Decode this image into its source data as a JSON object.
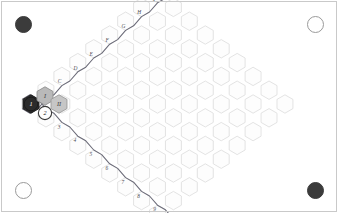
{
  "figure": {
    "width": 338,
    "height": 213,
    "background_color": "#ffffff",
    "frame_color": "#c9c9c9"
  },
  "lattice": {
    "description": "Rhombus-shaped honeycomb (hexagonal) lattice of pointy-top hexagons",
    "cell_stroke_color": "#dcdcdc",
    "cell_fill_color": "#fdfdfd",
    "hex_radius": 9.2,
    "columns": 17,
    "left_vertex": {
      "x": 30,
      "y": 104
    },
    "right_vertex": {
      "x": 312,
      "y": 104
    },
    "top_vertex": {
      "x": 176,
      "y": 14
    },
    "bottom_vertex": {
      "x": 176,
      "y": 196
    }
  },
  "boundary_paths": {
    "upper_left": {
      "name": "letter-edge-path",
      "stroke_color": "#6b6b78",
      "label_color": "#4a4a52",
      "labels": [
        "A",
        "B",
        "C",
        "D",
        "E",
        "F",
        "G",
        "H",
        "I",
        "J",
        "K"
      ]
    },
    "lower_left": {
      "name": "number-edge-path",
      "stroke_color": "#6b6b78",
      "label_color": "#4a4a52",
      "labels": [
        "1",
        "2",
        "3",
        "4",
        "5",
        "6",
        "7",
        "8",
        "9",
        "10",
        "11"
      ]
    }
  },
  "highlighted_cells": [
    {
      "label": "1",
      "kind": "filled-dark-hexagon",
      "fill": "#2b2b2b",
      "stroke": "#1a1a1a",
      "text_color": "#ffffff",
      "cx": 31,
      "cy": 104
    },
    {
      "label": "I",
      "kind": "filled-gray-hexagon",
      "fill": "#b9b9b9",
      "stroke": "#8e8e8e",
      "text_color": "#3a3a3a",
      "cx": 45,
      "cy": 96
    },
    {
      "label": "II",
      "kind": "filled-gray-hexagon",
      "fill": "#c6c6c6",
      "stroke": "#9a9a9a",
      "text_color": "#3a3a3a",
      "cx": 59,
      "cy": 104
    },
    {
      "label": "2",
      "kind": "open-circle-cell",
      "fill": "#ffffff",
      "stroke": "#3a3a3a",
      "text_color": "#1a1a1a",
      "cx": 45,
      "cy": 113
    }
  ],
  "corner_markers": [
    {
      "name": "corner-marker-top-left",
      "state": "filled",
      "cx": 23,
      "cy": 24,
      "r": 8.5
    },
    {
      "name": "corner-marker-top-right",
      "state": "open",
      "cx": 315,
      "cy": 24,
      "r": 8.5
    },
    {
      "name": "corner-marker-bottom-left",
      "state": "open",
      "cx": 23,
      "cy": 190,
      "r": 8.5
    },
    {
      "name": "corner-marker-bottom-right",
      "state": "filled",
      "cx": 315,
      "cy": 190,
      "r": 8.5
    }
  ]
}
